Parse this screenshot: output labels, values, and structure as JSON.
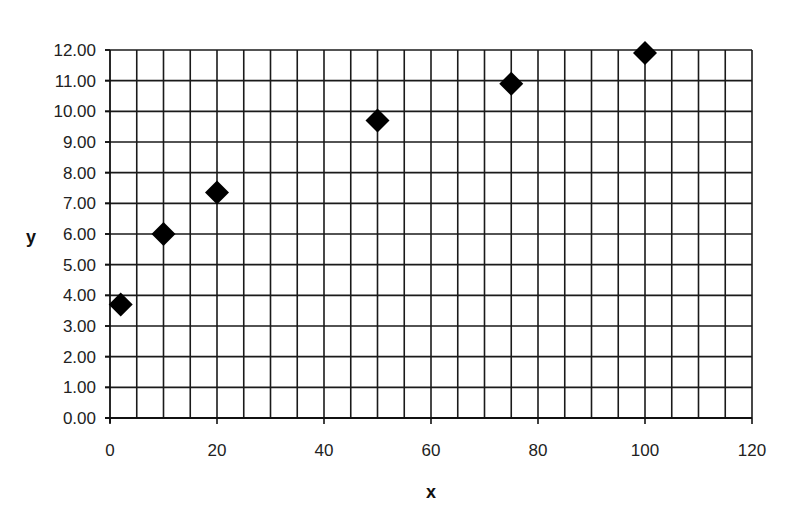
{
  "chart_data": {
    "type": "scatter",
    "title": "",
    "xlabel": "x",
    "ylabel": "y",
    "xlim": [
      0,
      120
    ],
    "ylim": [
      0,
      12
    ],
    "x_ticks": [
      "0",
      "20",
      "40",
      "60",
      "80",
      "100",
      "120"
    ],
    "y_ticks": [
      "0.00",
      "1.00",
      "2.00",
      "3.00",
      "4.00",
      "5.00",
      "6.00",
      "7.00",
      "8.00",
      "9.00",
      "10.00",
      "11.00",
      "12.00"
    ],
    "x_minor_step": 5,
    "y_step": 1,
    "grid": true,
    "legend": null,
    "marker": "diamond",
    "marker_color": "#000000",
    "series": [
      {
        "name": "y",
        "x": [
          2,
          10,
          20,
          50,
          75,
          100
        ],
        "y": [
          3.7,
          6.0,
          7.35,
          9.7,
          10.9,
          11.9
        ]
      }
    ]
  }
}
